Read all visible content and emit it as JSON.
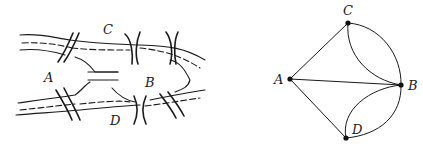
{
  "figure": {
    "left_panel": {
      "description": "Sketch of the seven bridges of Königsberg",
      "labels": {
        "A": "A",
        "B": "B",
        "C": "C",
        "D": "D"
      }
    },
    "right_panel": {
      "description": "Graph representation of the Königsberg bridges",
      "nodes": [
        {
          "id": "A",
          "label": "A",
          "x": 290,
          "y": 79
        },
        {
          "id": "B",
          "label": "B",
          "x": 401,
          "y": 85
        },
        {
          "id": "C",
          "label": "C",
          "x": 348,
          "y": 23
        },
        {
          "id": "D",
          "label": "D",
          "x": 346,
          "y": 138
        }
      ],
      "edges": [
        [
          "A",
          "C"
        ],
        [
          "A",
          "B"
        ],
        [
          "A",
          "D"
        ],
        [
          "C",
          "B"
        ],
        [
          "C",
          "B"
        ],
        [
          "D",
          "B"
        ],
        [
          "D",
          "B"
        ]
      ]
    }
  }
}
